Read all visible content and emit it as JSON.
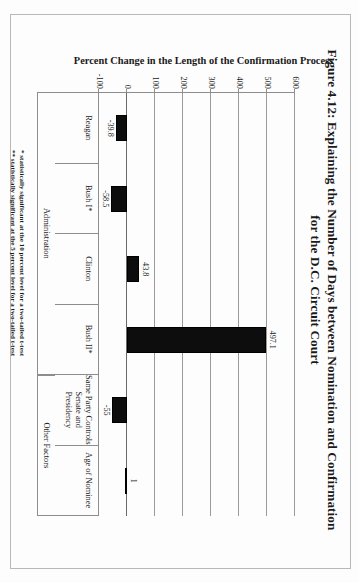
{
  "figure": {
    "title_line1": "Figure 4.12: Explaining the Number of Days between Nomination and Confirmation",
    "title_line2": "for the D.C. Circuit Court"
  },
  "axes": {
    "ylabel": "Percent Change in the Length of the Confirmation Process",
    "yticks": [
      "600",
      "500",
      "400",
      "300",
      "200",
      "100",
      "0",
      "-100"
    ]
  },
  "groups": [
    {
      "label": "Administration"
    },
    {
      "label": "Other Factors"
    }
  ],
  "notes": {
    "one_star": "* statistically significant at the 10 percent level for a two-tailed t-test",
    "two_star": "** statistically significant at the 5 percent level for a two-tailed t-test"
  },
  "chart_data": {
    "type": "bar",
    "title": "Figure 4.12: Explaining the Number of Days between Nomination and Confirmation for the D.C. Circuit Court",
    "xlabel": "",
    "ylabel": "Percent Change in the Length of the Confirmation Process",
    "ylim": [
      -100,
      600
    ],
    "yticks": [
      600,
      500,
      400,
      300,
      200,
      100,
      0,
      -100
    ],
    "grid": true,
    "legend": false,
    "categories": [
      "Reagan",
      "Bush I*",
      "Clinton",
      "Bush II*",
      "Same Party Controls Senate and Presidency",
      "Age of Nominee"
    ],
    "values": [
      -39.8,
      -58.5,
      43.8,
      497.1,
      -55,
      1
    ],
    "data_labels": [
      "-39.8",
      "-58.5",
      "43.8",
      "497.1",
      "-55",
      "1"
    ],
    "group_spans": [
      {
        "label": "Administration",
        "categories": [
          "Reagan",
          "Bush I*",
          "Clinton",
          "Bush II*"
        ]
      },
      {
        "label": "Other Factors",
        "categories": [
          "Same Party Controls Senate and Presidency",
          "Age of Nominee"
        ]
      }
    ],
    "annotations": [
      "* statistically significant at the 10 percent level for a two-tailed t-test",
      "** statistically significant at the 5 percent level for a two-tailed t-test"
    ],
    "bar_color": "#0d0d0d"
  }
}
